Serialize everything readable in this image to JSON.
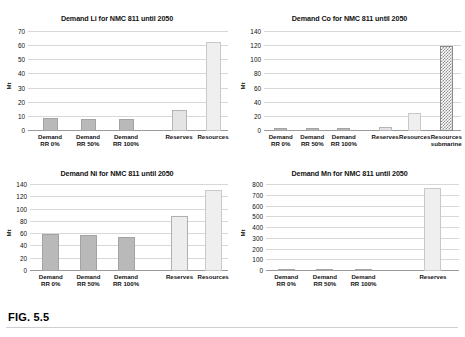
{
  "figure": {
    "caption": "FIG. 5.5",
    "ylabel": "Mt"
  },
  "charts": [
    {
      "id": "demand-li",
      "title": "Demand Li for NMC 811 until 2050",
      "ylabel": "Mt",
      "yticks": [
        "0",
        "10",
        "20",
        "30",
        "40",
        "50",
        "60",
        "70"
      ],
      "categories": [
        "Demand RR 0%",
        "Demand RR 50%",
        "Demand RR 100%",
        "Reserves",
        "Resources"
      ],
      "cat_l1": [
        "Demand",
        "Demand",
        "Demand",
        "Reserves",
        "Resources"
      ],
      "cat_l2": [
        "RR 0%",
        "RR 50%",
        "RR 100%",
        "",
        ""
      ],
      "values": [
        9,
        8.5,
        8.5,
        15,
        63
      ]
    },
    {
      "id": "demand-co",
      "title": "Demand Co for NMC 811 until 2050",
      "ylabel": "Mt",
      "yticks": [
        "0",
        "20",
        "40",
        "60",
        "80",
        "100",
        "120",
        "140"
      ],
      "categories": [
        "Demand RR 0%",
        "Demand RR 50%",
        "Demand RR 100%",
        "Reserves",
        "Resources",
        "Resources submarine"
      ],
      "cat_l1": [
        "Demand",
        "Demand",
        "Demand",
        "Reserves",
        "Resources",
        "Resources"
      ],
      "cat_l2": [
        "RR 0%",
        "RR 50%",
        "RR 100%",
        "",
        "",
        "submarine"
      ],
      "values": [
        4,
        4,
        4,
        5.5,
        25,
        120
      ]
    },
    {
      "id": "demand-ni",
      "title": "Demand Ni for NMC 811 until 2050",
      "ylabel": "Mt",
      "yticks": [
        "0",
        "20",
        "40",
        "60",
        "80",
        "100",
        "120",
        "140"
      ],
      "categories": [
        "Demand RR 0%",
        "Demand RR 50%",
        "Demand RR 100%",
        "Reserves",
        "Resources"
      ],
      "cat_l1": [
        "Demand",
        "Demand",
        "Demand",
        "Reserves",
        "Resources"
      ],
      "cat_l2": [
        "RR 0%",
        "RR 50%",
        "RR 100%",
        "",
        ""
      ],
      "values": [
        61,
        59,
        56,
        90,
        132
      ]
    },
    {
      "id": "demand-mn",
      "title": "Demand Mn for NMC 811 until 2050",
      "ylabel": "Mt",
      "yticks": [
        "0",
        "100",
        "200",
        "300",
        "400",
        "500",
        "600",
        "700",
        "800"
      ],
      "categories": [
        "Demand RR 0%",
        "Demand RR 50%",
        "Demand RR 100%",
        "Reserves"
      ],
      "cat_l1": [
        "Demand",
        "Demand",
        "Demand",
        "Reserves"
      ],
      "cat_l2": [
        "RR 0%",
        "RR 50%",
        "RR 100%",
        ""
      ],
      "values": [
        3,
        3,
        3,
        770
      ]
    }
  ],
  "chart_data": [
    {
      "type": "bar",
      "title": "Demand Li for NMC 811 until 2050",
      "xlabel": "",
      "ylabel": "Mt",
      "ylim": [
        0,
        70
      ],
      "ytick_step": 10,
      "grid": true,
      "legend": "none",
      "categories": [
        "Demand RR 0%",
        "Demand RR 50%",
        "Demand RR 100%",
        "Reserves",
        "Resources"
      ],
      "values": [
        9,
        8.5,
        8.5,
        15,
        63
      ]
    },
    {
      "type": "bar",
      "title": "Demand Co for NMC 811 until 2050",
      "xlabel": "",
      "ylabel": "Mt",
      "ylim": [
        0,
        140
      ],
      "ytick_step": 20,
      "grid": true,
      "legend": "none",
      "categories": [
        "Demand RR 0%",
        "Demand RR 50%",
        "Demand RR 100%",
        "Reserves",
        "Resources",
        "Resources submarine"
      ],
      "values": [
        4,
        4,
        4,
        5.5,
        25,
        120
      ]
    },
    {
      "type": "bar",
      "title": "Demand Ni for NMC 811 until 2050",
      "xlabel": "",
      "ylabel": "Mt",
      "ylim": [
        0,
        140
      ],
      "ytick_step": 20,
      "grid": true,
      "legend": "none",
      "categories": [
        "Demand RR 0%",
        "Demand RR 50%",
        "Demand RR 100%",
        "Reserves",
        "Resources"
      ],
      "values": [
        61,
        59,
        56,
        90,
        132
      ]
    },
    {
      "type": "bar",
      "title": "Demand Mn for NMC 811 until 2050",
      "xlabel": "",
      "ylabel": "Mt",
      "ylim": [
        0,
        800
      ],
      "ytick_step": 100,
      "grid": true,
      "legend": "none",
      "categories": [
        "Demand RR 0%",
        "Demand RR 50%",
        "Demand RR 100%",
        "Reserves"
      ],
      "values": [
        3,
        3,
        3,
        770
      ]
    }
  ]
}
